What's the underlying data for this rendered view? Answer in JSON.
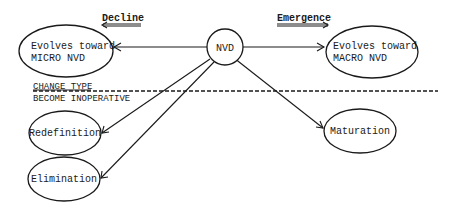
{
  "diagram": {
    "headings": {
      "decline": "Decline",
      "emergence": "Emergence"
    },
    "center_node": {
      "label": "NVD"
    },
    "nodes": {
      "micro": {
        "line1": "Evolves toward",
        "line2": "MICRO NVD"
      },
      "macro": {
        "line1": "Evolves toward",
        "line2": "MACRO NVD"
      },
      "redefinition": {
        "label": "Redefinition"
      },
      "elimination": {
        "label": "Elimination"
      },
      "maturation": {
        "label": "Maturation"
      }
    },
    "divider": {
      "above_label": "CHANGE TYPE",
      "below_label": "BECOME INOPERATIVE"
    },
    "edges": [
      {
        "from": "NVD",
        "to": "Evolves toward MICRO NVD"
      },
      {
        "from": "NVD",
        "to": "Evolves toward MACRO NVD"
      },
      {
        "from": "NVD",
        "to": "Redefinition"
      },
      {
        "from": "NVD",
        "to": "Elimination"
      },
      {
        "from": "NVD",
        "to": "Maturation"
      }
    ],
    "colors": {
      "ink": "#1a1a1a",
      "background": "#ffffff"
    }
  }
}
